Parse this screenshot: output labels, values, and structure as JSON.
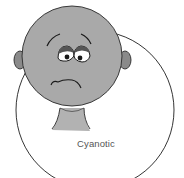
{
  "illustration": {
    "subject": "sad-face-cartoon",
    "caption": "Cyanotic",
    "colors": {
      "skin": "#a9a9a9",
      "ear": "#8a8a8a",
      "outline": "#2a2a2a",
      "background": "#ffffff",
      "ring": "#1e1e1e"
    }
  }
}
